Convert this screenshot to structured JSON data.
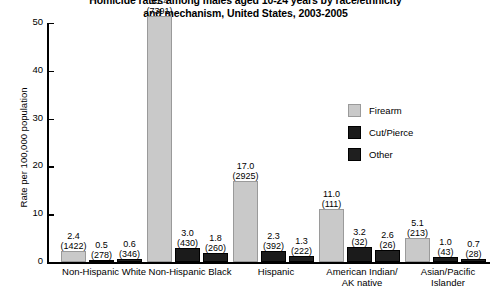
{
  "chart_data": {
    "type": "bar",
    "title": "Homicide rates among males aged 10-24 years by race/ethnicity and mechanism, United States, 2003-2005",
    "title_line1": "Homicide rates among males aged 10-24 years by race/ethnicity",
    "title_line2": "and mechanism, United States, 2003-2005",
    "xlabel": "",
    "ylabel": "Rate per 100,000 population",
    "ylim": [
      0,
      50
    ],
    "yticks": [
      0,
      10,
      20,
      30,
      40,
      50
    ],
    "ytick_labels": [
      "0",
      "10",
      "20",
      "30",
      "40",
      "50"
    ],
    "grid": false,
    "legend_position": "inside-right",
    "categories": [
      "Non-Hispanic White",
      "Non-Hispanic Black",
      "Hispanic",
      "American Indian/ AK native",
      "Asian/Pacific Islander"
    ],
    "category_lines": [
      [
        "Non-Hispanic White"
      ],
      [
        "Non-Hispanic Black"
      ],
      [
        "Hispanic"
      ],
      [
        "American Indian/",
        "AK native"
      ],
      [
        "Asian/Pacific",
        "Islander"
      ]
    ],
    "series": [
      {
        "name": "Firearm",
        "color": "#c9c9c9",
        "values": [
          2.4,
          51.4,
          17.0,
          11.0,
          5.1
        ],
        "value_labels": [
          "2.4",
          "51.4",
          "17.0",
          "11.0",
          "5.1"
        ],
        "counts": [
          1422,
          7391,
          2925,
          111,
          213
        ],
        "count_labels": [
          "(1422)",
          "(7391)",
          "(2925)",
          "(111)",
          "(213)"
        ]
      },
      {
        "name": "Cut/Pierce",
        "color": "#1b1b1b",
        "values": [
          0.5,
          3.0,
          2.3,
          3.2,
          1.0
        ],
        "value_labels": [
          "0.5",
          "3.0",
          "2.3",
          "3.2",
          "1.0"
        ],
        "counts": [
          278,
          430,
          392,
          32,
          43
        ],
        "count_labels": [
          "(278)",
          "(430)",
          "(392)",
          "(32)",
          "(43)"
        ]
      },
      {
        "name": "Other",
        "color": "#1f1f1f",
        "values": [
          0.6,
          1.8,
          1.3,
          2.6,
          0.7
        ],
        "value_labels": [
          "0.6",
          "1.8",
          "1.3",
          "2.6",
          "0.7"
        ],
        "counts": [
          346,
          260,
          222,
          26,
          28
        ],
        "count_labels": [
          "(346)",
          "(260)",
          "(222)",
          "(26)",
          "(28)"
        ]
      }
    ],
    "legend": [
      {
        "label": "Firearm",
        "color": "#c9c9c9"
      },
      {
        "label": "Cut/Pierce",
        "color": "#1b1b1b"
      },
      {
        "label": "Other",
        "color": "#1f1f1f"
      }
    ]
  }
}
